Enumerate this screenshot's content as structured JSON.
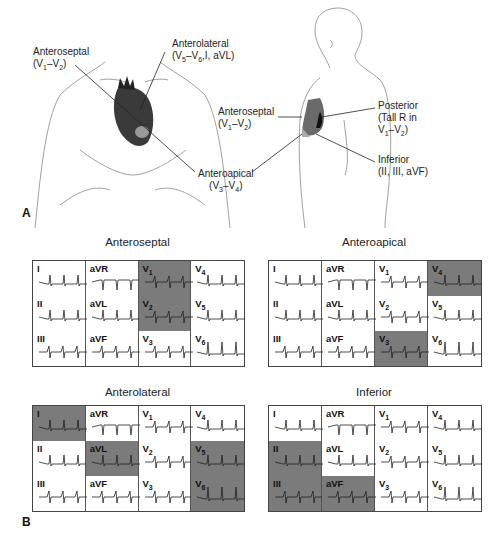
{
  "panel_a": {
    "letter": "A",
    "front_view_labels": [
      {
        "id": "anteroseptal",
        "name": "Anteroseptal",
        "leads": "(V1–V2)"
      },
      {
        "id": "anterolateral",
        "name": "Anterolateral",
        "leads": "(V5–V6,I, aVL)"
      },
      {
        "id": "anteroapical",
        "name": "Anteroapical",
        "leads": "(V3–V4)"
      }
    ],
    "side_view_labels": [
      {
        "id": "anteroseptal",
        "name": "Anteroseptal",
        "leads": "(V1–V2)"
      },
      {
        "id": "posterior",
        "name": "Posterior",
        "leads_line1": "(Tall R in",
        "leads_line2": "V1–V2)"
      },
      {
        "id": "inferior",
        "name": "Inferior",
        "leads": "(II, III, aVF)"
      }
    ]
  },
  "panel_b": {
    "letter": "B",
    "grids": [
      {
        "title": "Anteroseptal",
        "shaded": [
          "V1",
          "V2"
        ]
      },
      {
        "title": "Anteroapical",
        "shaded": [
          "V3",
          "V4"
        ]
      },
      {
        "title": "Anterolateral",
        "shaded": [
          "I",
          "aVL",
          "V5",
          "V6"
        ]
      },
      {
        "title": "Inferior",
        "shaded": [
          "II",
          "III",
          "aVF"
        ]
      }
    ],
    "lead_layout": [
      [
        "I",
        "aVR",
        "V1",
        "V4"
      ],
      [
        "II",
        "aVL",
        "V2",
        "V5"
      ],
      [
        "III",
        "aVF",
        "V3",
        "V6"
      ]
    ]
  },
  "colors": {
    "shade": "#7b7b7b",
    "border": "#444444",
    "background": "#ffffff"
  }
}
